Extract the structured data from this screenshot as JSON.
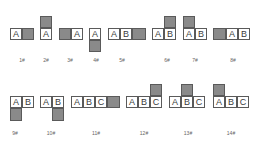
{
  "diagram": {
    "title": "",
    "colors": {
      "filled": "#8a8a8a",
      "border": "#5a5a5a",
      "empty": "#ffffff"
    },
    "configurations": [
      {
        "label": "1#",
        "cells": [
          "A"
        ],
        "filled_position": "right"
      },
      {
        "label": "2#",
        "cells": [
          "A"
        ],
        "filled_position": "above A"
      },
      {
        "label": "3#",
        "cells": [
          "A"
        ],
        "filled_position": "left"
      },
      {
        "label": "4#",
        "cells": [
          "A"
        ],
        "filled_position": "below A"
      },
      {
        "label": "5#",
        "cells": [
          "A",
          "B"
        ],
        "filled_position": "right"
      },
      {
        "label": "6#",
        "cells": [
          "A",
          "B"
        ],
        "filled_position": "above B"
      },
      {
        "label": "7#",
        "cells": [
          "A",
          "B"
        ],
        "filled_position": "above A"
      },
      {
        "label": "8#",
        "cells": [
          "A",
          "B"
        ],
        "filled_position": "left"
      },
      {
        "label": "9#",
        "cells": [
          "A",
          "B"
        ],
        "filled_position": "below A"
      },
      {
        "label": "10#",
        "cells": [
          "A",
          "B"
        ],
        "filled_position": "below B"
      },
      {
        "label": "11#",
        "cells": [
          "A",
          "B",
          "C"
        ],
        "filled_position": "right"
      },
      {
        "label": "12#",
        "cells": [
          "A",
          "B",
          "C"
        ],
        "filled_position": "above C"
      },
      {
        "label": "13#",
        "cells": [
          "A",
          "B",
          "C"
        ],
        "filled_position": "above B"
      },
      {
        "label": "14#",
        "cells": [
          "A",
          "B",
          "C"
        ],
        "filled_position": "above A"
      }
    ]
  }
}
